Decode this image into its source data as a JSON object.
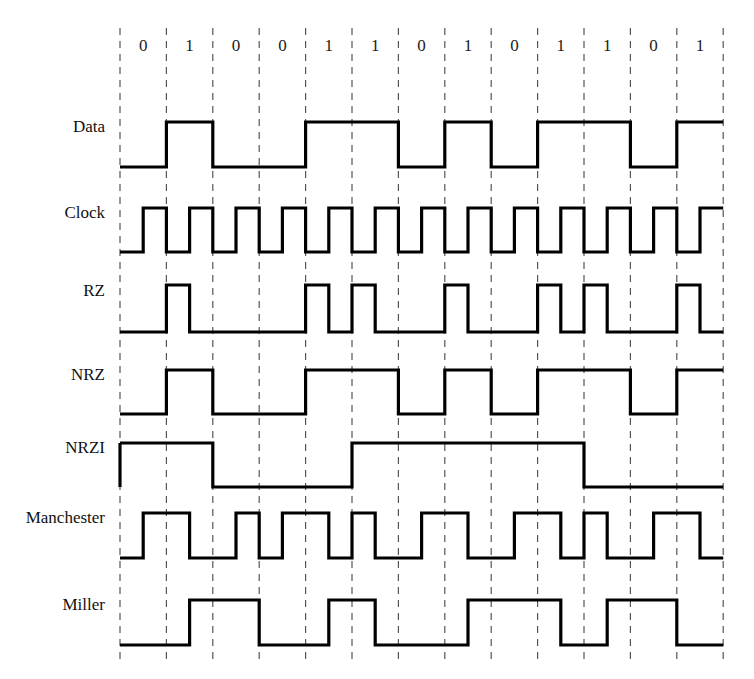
{
  "figure": {
    "bit_label_row_name": "bit-sequence",
    "stroke_color": "#000000",
    "grid_color": "#555555",
    "background_color": "#ffffff"
  },
  "chart_data": {
    "type": "line",
    "xlabel": "",
    "ylabel": "",
    "grid": true,
    "legend_position": "left-labels",
    "bit_period_px": 46.4,
    "x_start_px": 120,
    "x_end_px": 723,
    "categories": [
      "0",
      "1",
      "0",
      "0",
      "1",
      "1",
      "0",
      "1",
      "0",
      "1",
      "1",
      "0",
      "1"
    ],
    "bits": [
      0,
      1,
      0,
      0,
      1,
      1,
      0,
      1,
      0,
      1,
      1,
      0,
      1
    ],
    "bit_count": 13,
    "series": [
      {
        "name": "Data",
        "encoding": "nrz-level",
        "description": "High for 1, low for 0, held for the full bit period",
        "samples_per_bit": 1,
        "levels": [
          0,
          1,
          0,
          0,
          1,
          1,
          0,
          1,
          0,
          1,
          1,
          0,
          1
        ]
      },
      {
        "name": "Clock",
        "encoding": "clock",
        "description": "Low during first half of each bit cell, high during second half",
        "samples_per_bit": 2,
        "levels": [
          0,
          1,
          0,
          1,
          0,
          1,
          0,
          1,
          0,
          1,
          0,
          1,
          0,
          1,
          0,
          1,
          0,
          1,
          0,
          1,
          0,
          1,
          0,
          1,
          0,
          1
        ]
      },
      {
        "name": "RZ",
        "encoding": "return-to-zero",
        "description": "Pulse high for first half of bit cell when bit is 1, otherwise low",
        "samples_per_bit": 2,
        "levels": [
          0,
          0,
          1,
          0,
          0,
          0,
          0,
          0,
          1,
          0,
          1,
          0,
          0,
          0,
          1,
          0,
          0,
          0,
          1,
          0,
          1,
          0,
          0,
          0,
          1,
          0
        ]
      },
      {
        "name": "NRZ",
        "encoding": "non-return-to-zero",
        "description": "Same as Data: high for 1, low for 0 over the whole bit period",
        "samples_per_bit": 1,
        "levels": [
          0,
          1,
          0,
          0,
          1,
          1,
          0,
          1,
          0,
          1,
          1,
          0,
          1
        ]
      },
      {
        "name": "NRZI",
        "encoding": "non-return-to-zero-inverted",
        "description": "Starts high; level toggles at the start of every 1 bit and holds otherwise",
        "samples_per_bit": 1,
        "levels": [
          1,
          1,
          0,
          0,
          0,
          1,
          1,
          1,
          1,
          1,
          0,
          0,
          0
        ]
      },
      {
        "name": "Manchester",
        "encoding": "manchester",
        "description": "Mid-bit transition: 0 is low-then-high, 1 is high-then-low",
        "samples_per_bit": 2,
        "levels": [
          0,
          1,
          1,
          0,
          0,
          1,
          0,
          1,
          1,
          0,
          1,
          0,
          0,
          1,
          1,
          0,
          0,
          1,
          1,
          0,
          1,
          0,
          0,
          1,
          1,
          0
        ]
      },
      {
        "name": "Miller",
        "encoding": "delay-modulation",
        "description": "Transition at mid-bit for a 1; transition at bit boundary between consecutive 0s",
        "samples_per_bit": 2,
        "levels": [
          0,
          0,
          0,
          1,
          1,
          1,
          0,
          0,
          0,
          1,
          1,
          0,
          0,
          0,
          0,
          1,
          1,
          1,
          1,
          0,
          0,
          1,
          1,
          1,
          0,
          0
        ]
      }
    ]
  },
  "rows": [
    {
      "label": "Data",
      "y_high": 122,
      "y_low": 167
    },
    {
      "label": "Clock",
      "y_high": 208,
      "y_low": 252
    },
    {
      "label": "RZ",
      "y_high": 285,
      "y_low": 332
    },
    {
      "label": "NRZ",
      "y_high": 370,
      "y_low": 414
    },
    {
      "label": "NRZI",
      "y_high": 443,
      "y_low": 487
    },
    {
      "label": "Manchester",
      "y_high": 513,
      "y_low": 558
    },
    {
      "label": "Miller",
      "y_high": 600,
      "y_low": 645
    }
  ],
  "bit_label_y": 47,
  "grid_top": 28,
  "grid_bottom": 660,
  "label_x": 105
}
